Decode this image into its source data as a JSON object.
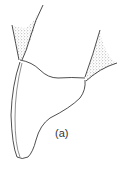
{
  "figure": {
    "label": "(a)",
    "colors": {
      "line": "#222222",
      "stipple": "#555555",
      "background": "#ffffff"
    }
  }
}
